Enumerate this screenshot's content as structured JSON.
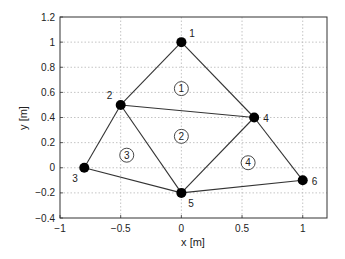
{
  "chart_data": {
    "type": "scatter",
    "title": "",
    "xlabel": "x [m]",
    "ylabel": "y [m]",
    "xlim": [
      -1,
      1.2
    ],
    "ylim": [
      -0.4,
      1.2
    ],
    "grid": true,
    "x_ticks": [
      -1,
      -0.5,
      0,
      0.5,
      1
    ],
    "x_tick_labels": [
      "−1",
      "−0.5",
      "0",
      "0.5",
      "1"
    ],
    "y_ticks": [
      -0.4,
      -0.2,
      0,
      0.2,
      0.4,
      0.6,
      0.8,
      1,
      1.2
    ],
    "y_tick_labels": [
      "−0.4",
      "−0.2",
      "0",
      "0.2",
      "0.4",
      "0.6",
      "0.8",
      "1",
      "1.2"
    ],
    "nodes": [
      {
        "id": "1",
        "x": 0,
        "y": 1
      },
      {
        "id": "2",
        "x": -0.5,
        "y": 0.5
      },
      {
        "id": "3",
        "x": -0.8,
        "y": 0
      },
      {
        "id": "4",
        "x": 0.6,
        "y": 0.4
      },
      {
        "id": "5",
        "x": 0,
        "y": -0.2
      },
      {
        "id": "6",
        "x": 1,
        "y": -0.1
      }
    ],
    "elements": [
      {
        "id": "1",
        "nodes": [
          "1",
          "2",
          "4"
        ],
        "label_x": 0.0,
        "label_y": 0.63
      },
      {
        "id": "2",
        "nodes": [
          "2",
          "5",
          "4"
        ],
        "label_x": 0.0,
        "label_y": 0.25
      },
      {
        "id": "3",
        "nodes": [
          "2",
          "3",
          "5"
        ],
        "label_x": -0.45,
        "label_y": 0.1
      },
      {
        "id": "4",
        "nodes": [
          "4",
          "5",
          "6"
        ],
        "label_x": 0.55,
        "label_y": 0.04
      }
    ]
  }
}
